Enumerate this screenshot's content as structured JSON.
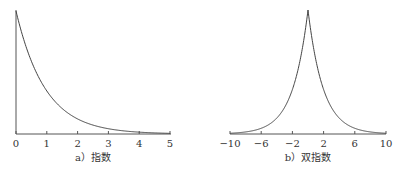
{
  "chart_data": [
    {
      "type": "line",
      "title": "",
      "caption": "a）指数",
      "xlabel": "",
      "ylabel": "",
      "xlim": [
        0,
        5
      ],
      "xticks": [
        "0",
        "1",
        "2",
        "3",
        "4",
        "5"
      ],
      "grid": false,
      "function": "exponential density, lambda=1: f(x)=e^(-x)",
      "x": [
        0,
        0.25,
        0.5,
        0.75,
        1,
        1.5,
        2,
        2.5,
        3,
        3.5,
        4,
        4.5,
        5
      ],
      "values": [
        1.0,
        0.779,
        0.607,
        0.472,
        0.368,
        0.223,
        0.135,
        0.082,
        0.05,
        0.03,
        0.018,
        0.011,
        0.007
      ]
    },
    {
      "type": "line",
      "title": "",
      "caption": "b）双指数",
      "xlabel": "",
      "ylabel": "",
      "xlim": [
        -10,
        10
      ],
      "xticks": [
        "−10",
        "−6",
        "−2",
        "2",
        "6",
        "10"
      ],
      "grid": false,
      "function": "double exponential (Laplace) density: f(x)=0.5*e^(-|x|/b)",
      "x": [
        -10,
        -8,
        -6,
        -4,
        -2,
        -1,
        0,
        1,
        2,
        4,
        6,
        8,
        10
      ],
      "values": [
        0.004,
        0.009,
        0.02,
        0.045,
        0.1,
        0.16,
        0.25,
        0.16,
        0.1,
        0.045,
        0.02,
        0.009,
        0.004
      ]
    }
  ]
}
